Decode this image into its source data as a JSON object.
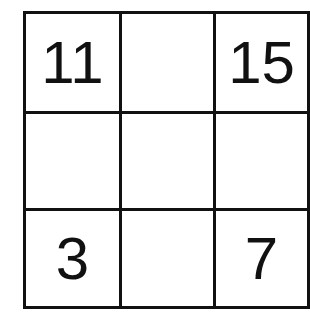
{
  "puzzle": {
    "rows": 3,
    "cols": 3,
    "cells": [
      [
        "11",
        "",
        "15"
      ],
      [
        "",
        "",
        ""
      ],
      [
        "3",
        "",
        "7"
      ]
    ]
  },
  "colors": {
    "line": "#111111",
    "text": "#111111",
    "background": "#ffffff"
  }
}
